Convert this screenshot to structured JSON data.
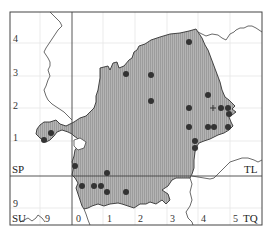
{
  "map": {
    "frame": {
      "x": 10,
      "y": 12,
      "w": 252,
      "h": 213
    },
    "colors": {
      "region_fill": "#a9a9a9",
      "region_stroke": "#333333",
      "grid_major": "#444444",
      "grid_minor": "#e2e2e2",
      "dot": "#333333",
      "boundary": "#444444"
    },
    "grid_squares": {
      "SP": "SP",
      "TL": "TL",
      "SU": "SU",
      "TQ": "TQ"
    },
    "left_labels": [
      "4",
      "3",
      "2",
      "1",
      "9"
    ],
    "bottom_labels": [
      "9",
      "0",
      "1",
      "2",
      "3",
      "4",
      "5"
    ],
    "dots": [
      [
        189,
        42
      ],
      [
        126,
        74
      ],
      [
        151,
        75
      ],
      [
        151,
        101
      ],
      [
        208,
        95
      ],
      [
        189,
        108
      ],
      [
        221,
        108
      ],
      [
        228,
        108
      ],
      [
        229,
        114
      ],
      [
        189,
        127
      ],
      [
        208,
        127
      ],
      [
        214,
        127
      ],
      [
        228,
        127
      ],
      [
        195,
        141
      ],
      [
        195,
        148
      ],
      [
        51,
        133
      ],
      [
        44,
        140
      ],
      [
        75,
        166
      ],
      [
        107,
        173
      ],
      [
        82,
        186
      ],
      [
        94,
        186
      ],
      [
        101,
        186
      ],
      [
        107,
        192
      ],
      [
        126,
        192
      ]
    ],
    "crosses": [
      [
        213,
        108
      ]
    ]
  }
}
